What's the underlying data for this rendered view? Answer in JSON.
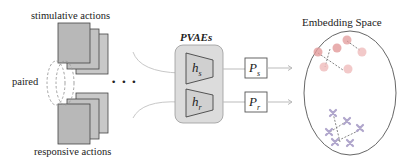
{
  "left_group": {
    "top_label": "stimulative actions",
    "bottom_label": "responsive actions",
    "pair_label": "paired",
    "ellipsis": "• • •"
  },
  "model": {
    "title": "PVAEs",
    "encoders": [
      {
        "symbol": "h",
        "subscript": "s"
      },
      {
        "symbol": "h",
        "subscript": "r"
      }
    ],
    "projections": [
      {
        "symbol": "P",
        "subscript": "s"
      },
      {
        "symbol": "P",
        "subscript": "r"
      }
    ]
  },
  "embedding": {
    "title": "Embedding Space",
    "circle_color": "#e5a8a8",
    "cross_color": "#b4a8cf"
  },
  "colors": {
    "card_fill": "#bdbdbd",
    "card_border": "#444444",
    "panel_fill": "#d9d9d9",
    "line": "#bbbbbb"
  }
}
